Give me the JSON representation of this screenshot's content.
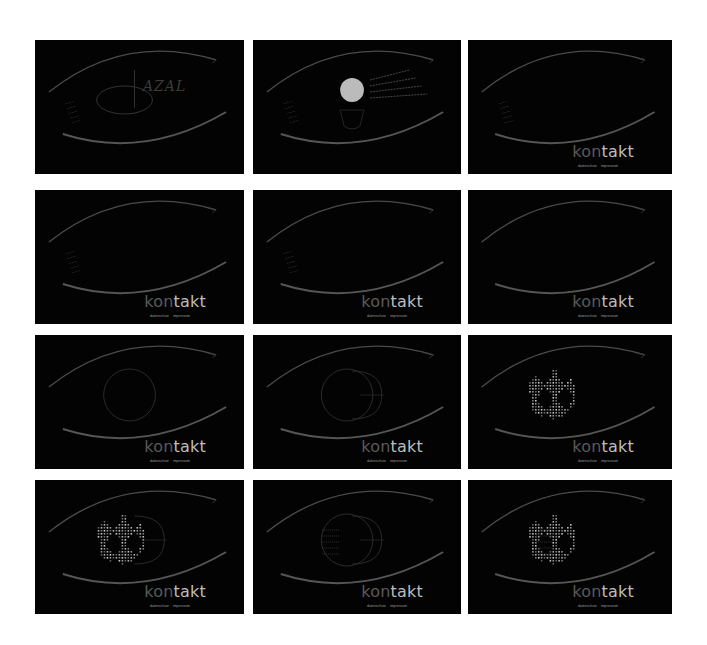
{
  "layout": {
    "background": "#ffffff",
    "panel_background": "#030303",
    "columns_x": [
      35,
      253,
      468
    ],
    "column_widths": [
      209,
      208,
      204
    ],
    "rows_y": [
      40,
      190,
      335,
      480
    ],
    "row_height": 134
  },
  "panels": [
    {
      "id": 1,
      "stage": "logo-intro",
      "logo": "AZAL",
      "kontakt": false
    },
    {
      "id": 2,
      "stage": "portrait-info",
      "kontakt": false
    },
    {
      "id": 3,
      "stage": "kontakt-appear",
      "kontakt": true
    },
    {
      "id": 4,
      "stage": "kontakt",
      "kontakt": true
    },
    {
      "id": 5,
      "stage": "kontakt-menu-fade",
      "kontakt": true
    },
    {
      "id": 6,
      "stage": "kontakt-empty",
      "kontakt": true
    },
    {
      "id": 7,
      "stage": "iris-circle",
      "kontakt": true
    },
    {
      "id": 8,
      "stage": "iris-circle-line",
      "kontakt": true
    },
    {
      "id": 9,
      "stage": "globe-dotted",
      "kontakt": true
    },
    {
      "id": 10,
      "stage": "globe-grid",
      "kontakt": true
    },
    {
      "id": 11,
      "stage": "address",
      "kontakt": true
    },
    {
      "id": 12,
      "stage": "globe-final",
      "kontakt": true
    }
  ],
  "branding": {
    "title_dim": "kon",
    "title_bright": "takt",
    "sublinks": [
      "datenschutz",
      "impressum"
    ],
    "logo": "AZAL"
  }
}
